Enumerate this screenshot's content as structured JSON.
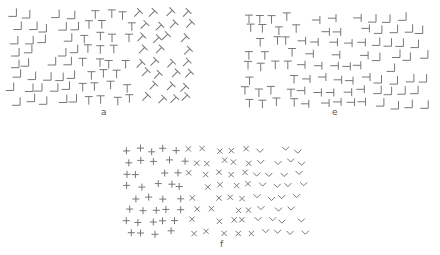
{
  "figure": {
    "stroke_color": "#777777",
    "background": "#ffffff",
    "panels": [
      {
        "id": "a",
        "label": "a",
        "label_pos": [
          101,
          108
        ],
        "grid": {
          "x0": 12,
          "y0": 14,
          "dx": 14.2,
          "dy": 12.2,
          "cols": 13,
          "rows": 8,
          "jitter": 3.5,
          "size": 8
        },
        "regions": [
          {
            "cols": [
              0,
              4
            ],
            "glyph": "L-corner-right",
            "description": "L-shapes (horizontal stroke with vertical on right)"
          },
          {
            "cols": [
              5,
              8
            ],
            "glyph": "T",
            "rotation": 0,
            "description": "upright T"
          },
          {
            "cols": [
              9,
              12
            ],
            "glyph": "T",
            "rotation": 45,
            "description": "T rotated 45 degrees"
          }
        ]
      },
      {
        "id": "e",
        "label": "e",
        "label_pos": [
          112,
          108
        ],
        "grid": {
          "x0": 26,
          "y0": 18,
          "dx": 14.2,
          "dy": 12.2,
          "cols": 13,
          "rows": 8,
          "jitter": 3.5,
          "size": 8
        },
        "regions": [
          {
            "cols": [
              0,
              3
            ],
            "glyph": "T",
            "rotation": 0,
            "description": "upright T"
          },
          {
            "cols": [
              4,
              8
            ],
            "glyph": "T",
            "rotation": 90,
            "description": "T rotated 90 degrees (sideways)"
          },
          {
            "cols": [
              9,
              12
            ],
            "glyph": "L-corner-right",
            "description": "L-shapes"
          }
        ]
      },
      {
        "id": "f",
        "label": "f",
        "label_pos": [
          120,
          110
        ],
        "grid": {
          "x0": 24,
          "y0": 20,
          "dx": 13.4,
          "dy": 11.8,
          "cols": 14,
          "rows": 8,
          "jitter": 3.2,
          "size": 7
        },
        "regions": [
          {
            "cols": [
              0,
              4
            ],
            "glyph": "plus",
            "description": "upright crosses (+)"
          },
          {
            "cols": [
              5,
              9
            ],
            "glyph": "x",
            "description": "diagonal crosses (x)"
          },
          {
            "cols": [
              10,
              13
            ],
            "glyph": "v",
            "description": "V chevrons"
          }
        ]
      }
    ]
  }
}
